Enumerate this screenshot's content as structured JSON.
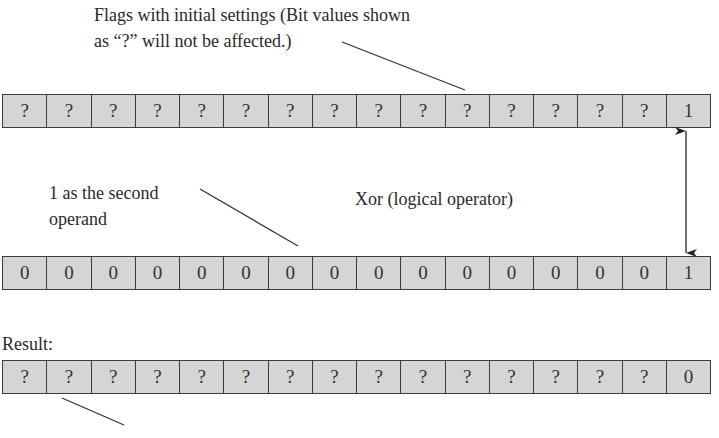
{
  "annotations": {
    "flags_line1": "Flags with initial settings (Bit values shown",
    "flags_line2": "as “?” will not be affected.)",
    "operand_line1": "1 as the second",
    "operand_line2": "operand",
    "operator": "Xor (logical operator)",
    "result_label": "Result:"
  },
  "registers": {
    "flags": [
      "?",
      "?",
      "?",
      "?",
      "?",
      "?",
      "?",
      "?",
      "?",
      "?",
      "?",
      "?",
      "?",
      "?",
      "?",
      "1"
    ],
    "operand": [
      "0",
      "0",
      "0",
      "0",
      "0",
      "0",
      "0",
      "0",
      "0",
      "0",
      "0",
      "0",
      "0",
      "0",
      "0",
      "1"
    ],
    "result": [
      "?",
      "?",
      "?",
      "?",
      "?",
      "?",
      "?",
      "?",
      "?",
      "?",
      "?",
      "?",
      "?",
      "?",
      "?",
      "0"
    ]
  },
  "colors": {
    "cell_fill": "#d5d5d5",
    "border": "#3a3a3a",
    "line": "#333333"
  }
}
